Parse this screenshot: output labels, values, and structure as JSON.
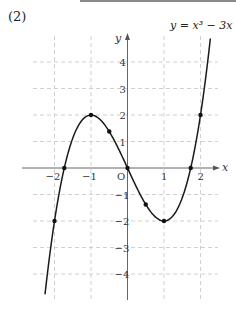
{
  "problem": {
    "label": "(2)"
  },
  "chart_data": {
    "type": "line",
    "title": "",
    "function_label": "y = x³ − 3x",
    "xlabel": "x",
    "ylabel": "y",
    "origin_label": "O",
    "xlim": [
      -2.6,
      2.5
    ],
    "ylim": [
      -5.0,
      5.0
    ],
    "grid": true,
    "x_ticks": [
      {
        "value": -2,
        "label": "−2"
      },
      {
        "value": -1,
        "label": "−1"
      },
      {
        "value": 1,
        "label": "1"
      },
      {
        "value": 2,
        "label": "2"
      }
    ],
    "y_ticks": [
      {
        "value": 4,
        "label": "4"
      },
      {
        "value": 3,
        "label": "3"
      },
      {
        "value": 2,
        "label": "2"
      },
      {
        "value": 1,
        "label": "1"
      },
      {
        "value": -1,
        "label": "−1"
      },
      {
        "value": -2,
        "label": "−2"
      },
      {
        "value": -3,
        "label": "−3"
      },
      {
        "value": -4,
        "label": "−4"
      }
    ],
    "series": [
      {
        "name": "y = x^3 - 3x",
        "x_range": [
          -2.26,
          2.27
        ],
        "marked_points": [
          {
            "x": -2,
            "y": -2
          },
          {
            "x": -1.732,
            "y": 0
          },
          {
            "x": -1,
            "y": 2
          },
          {
            "x": -0.5,
            "y": 1.375
          },
          {
            "x": 0,
            "y": 0
          },
          {
            "x": 0.5,
            "y": -1.375
          },
          {
            "x": 1,
            "y": -2
          },
          {
            "x": 1.732,
            "y": 0
          },
          {
            "x": 2,
            "y": 2
          }
        ]
      }
    ]
  }
}
